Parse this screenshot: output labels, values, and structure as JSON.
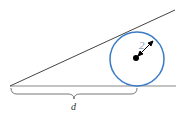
{
  "diagram": {
    "radius_label": "2",
    "distance_label": "d",
    "colors": {
      "lines": "#444444",
      "ground": "#888888",
      "circle": "#3a7bc8",
      "center": "#000000",
      "radius_label": "#8a9bb0"
    }
  }
}
